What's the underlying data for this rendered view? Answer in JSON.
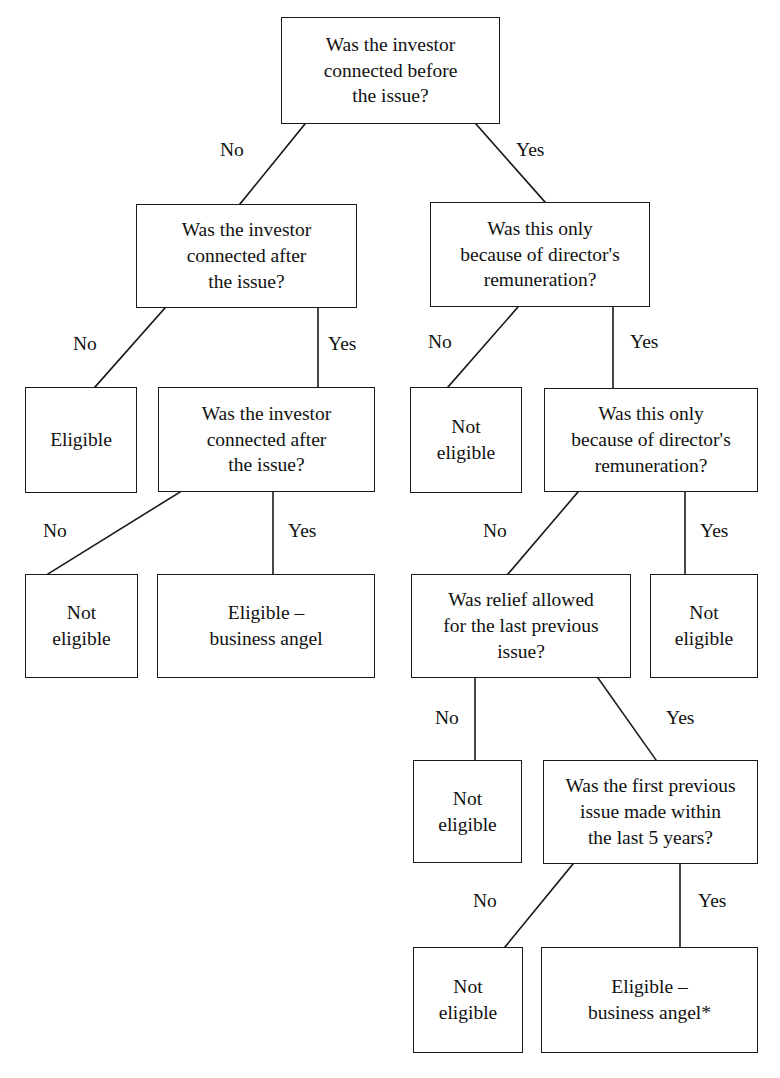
{
  "diagram": {
    "type": "decision-tree-flowchart",
    "background_color": "#ffffff",
    "line_color": "#1a1a1a",
    "text_color": "#111111",
    "nodes": [
      {
        "id": "q_connected_before",
        "kind": "decision",
        "text": "Was the investor\nconnected before\nthe issue?",
        "x": 281,
        "y": 17,
        "w": 219,
        "h": 107
      },
      {
        "id": "q_connected_after_left",
        "kind": "decision",
        "text": "Was the investor\nconnected after\nthe issue?",
        "x": 136,
        "y": 204,
        "w": 221,
        "h": 104
      },
      {
        "id": "q_directors_remuneration_1",
        "kind": "decision",
        "text": "Was this only\nbecause of director's\nremuneration?",
        "x": 430,
        "y": 202,
        "w": 220,
        "h": 105
      },
      {
        "id": "r_eligible_1",
        "kind": "outcome",
        "text": "Eligible",
        "x": 25,
        "y": 387,
        "w": 112,
        "h": 106
      },
      {
        "id": "q_connected_after_2",
        "kind": "decision",
        "text": "Was the investor\nconnected after\nthe issue?",
        "x": 158,
        "y": 387,
        "w": 217,
        "h": 105
      },
      {
        "id": "r_not_eligible_1",
        "kind": "outcome",
        "text": "Not\neligible",
        "x": 410,
        "y": 387,
        "w": 112,
        "h": 106
      },
      {
        "id": "q_directors_remuneration_2",
        "kind": "decision",
        "text": "Was this only\nbecause of director's\nremuneration?",
        "x": 544,
        "y": 388,
        "w": 214,
        "h": 104
      },
      {
        "id": "r_not_eligible_2",
        "kind": "outcome",
        "text": "Not\neligible",
        "x": 25,
        "y": 574,
        "w": 113,
        "h": 104
      },
      {
        "id": "r_eligible_angel_1",
        "kind": "outcome",
        "text": "Eligible –\nbusiness angel",
        "x": 157,
        "y": 574,
        "w": 218,
        "h": 104
      },
      {
        "id": "q_relief_allowed",
        "kind": "decision",
        "text": "Was relief allowed\nfor the last previous\nissue?",
        "x": 411,
        "y": 574,
        "w": 220,
        "h": 104
      },
      {
        "id": "r_not_eligible_3",
        "kind": "outcome",
        "text": "Not\neligible",
        "x": 650,
        "y": 574,
        "w": 108,
        "h": 104
      },
      {
        "id": "r_not_eligible_4",
        "kind": "outcome",
        "text": "Not\neligible",
        "x": 413,
        "y": 760,
        "w": 109,
        "h": 103
      },
      {
        "id": "q_first_previous_5_years",
        "kind": "decision",
        "text": "Was the first previous\nissue made within\nthe last 5 years?",
        "x": 543,
        "y": 760,
        "w": 215,
        "h": 104
      },
      {
        "id": "r_not_eligible_5",
        "kind": "outcome",
        "text": "Not\neligible",
        "x": 413,
        "y": 947,
        "w": 110,
        "h": 106
      },
      {
        "id": "r_eligible_angel_2",
        "kind": "outcome",
        "text": "Eligible –\nbusiness angel*",
        "x": 541,
        "y": 947,
        "w": 217,
        "h": 106
      }
    ],
    "edges": [
      {
        "id": "e1",
        "from": "q_connected_before",
        "to": "q_connected_after_left",
        "label": "No",
        "x1": 305,
        "y1": 124,
        "x2": 240,
        "y2": 204
      },
      {
        "id": "e2",
        "from": "q_connected_before",
        "to": "q_directors_remuneration_1",
        "label": "Yes",
        "x1": 476,
        "y1": 124,
        "x2": 545,
        "y2": 202
      },
      {
        "id": "e3",
        "from": "q_connected_after_left",
        "to": "r_eligible_1",
        "label": "No",
        "x1": 165,
        "y1": 308,
        "x2": 95,
        "y2": 387
      },
      {
        "id": "e4",
        "from": "q_connected_after_left",
        "to": "q_connected_after_2",
        "label": "Yes",
        "x1": 318,
        "y1": 308,
        "x2": 318,
        "y2": 387
      },
      {
        "id": "e5",
        "from": "q_directors_remuneration_1",
        "to": "r_not_eligible_1",
        "label": "No",
        "x1": 518,
        "y1": 307,
        "x2": 448,
        "y2": 387
      },
      {
        "id": "e6",
        "from": "q_directors_remuneration_1",
        "to": "q_directors_remuneration_2",
        "label": "Yes",
        "x1": 613,
        "y1": 307,
        "x2": 613,
        "y2": 388
      },
      {
        "id": "e7",
        "from": "q_connected_after_2",
        "to": "r_not_eligible_2",
        "label": "No",
        "x1": 180,
        "y1": 492,
        "x2": 48,
        "y2": 574
      },
      {
        "id": "e8",
        "from": "q_connected_after_2",
        "to": "r_eligible_angel_1",
        "label": "Yes",
        "x1": 273,
        "y1": 492,
        "x2": 273,
        "y2": 574
      },
      {
        "id": "e9",
        "from": "q_directors_remuneration_2",
        "to": "q_relief_allowed",
        "label": "No",
        "x1": 578,
        "y1": 492,
        "x2": 508,
        "y2": 574
      },
      {
        "id": "e10",
        "from": "q_directors_remuneration_2",
        "to": "r_not_eligible_3",
        "label": "Yes",
        "x1": 685,
        "y1": 492,
        "x2": 685,
        "y2": 574
      },
      {
        "id": "e11",
        "from": "q_relief_allowed",
        "to": "r_not_eligible_4",
        "label": "No",
        "x1": 475,
        "y1": 678,
        "x2": 475,
        "y2": 760
      },
      {
        "id": "e12",
        "from": "q_relief_allowed",
        "to": "q_first_previous_5_years",
        "label": "Yes",
        "x1": 598,
        "y1": 678,
        "x2": 656,
        "y2": 760
      },
      {
        "id": "e13",
        "from": "q_first_previous_5_years",
        "to": "r_not_eligible_5",
        "label": "No",
        "x1": 573,
        "y1": 864,
        "x2": 505,
        "y2": 947
      },
      {
        "id": "e14",
        "from": "q_first_previous_5_years",
        "to": "r_eligible_angel_2",
        "label": "Yes",
        "x1": 680,
        "y1": 864,
        "x2": 680,
        "y2": 947
      }
    ],
    "edge_labels": [
      {
        "id": "l1",
        "text": "No",
        "x": 220,
        "y": 140
      },
      {
        "id": "l2",
        "text": "Yes",
        "x": 516,
        "y": 140
      },
      {
        "id": "l3",
        "text": "No",
        "x": 73,
        "y": 334
      },
      {
        "id": "l4",
        "text": "Yes",
        "x": 328,
        "y": 334
      },
      {
        "id": "l5",
        "text": "No",
        "x": 428,
        "y": 332
      },
      {
        "id": "l6",
        "text": "Yes",
        "x": 630,
        "y": 332
      },
      {
        "id": "l7",
        "text": "No",
        "x": 43,
        "y": 521
      },
      {
        "id": "l8",
        "text": "Yes",
        "x": 288,
        "y": 521
      },
      {
        "id": "l9",
        "text": "No",
        "x": 483,
        "y": 521
      },
      {
        "id": "l10",
        "text": "Yes",
        "x": 700,
        "y": 521
      },
      {
        "id": "l11",
        "text": "No",
        "x": 435,
        "y": 708
      },
      {
        "id": "l12",
        "text": "Yes",
        "x": 666,
        "y": 708
      },
      {
        "id": "l13",
        "text": "No",
        "x": 473,
        "y": 891
      },
      {
        "id": "l14",
        "text": "Yes",
        "x": 698,
        "y": 891
      }
    ]
  }
}
